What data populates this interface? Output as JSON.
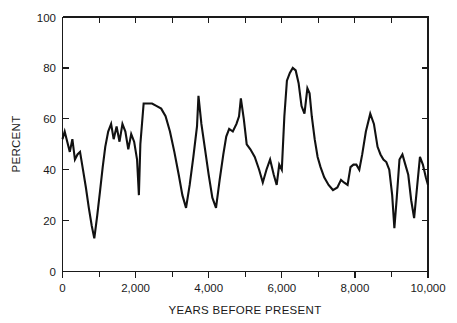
{
  "chart_data": {
    "type": "line",
    "title": "",
    "subtitle": "",
    "xlabel": "YEARS BEFORE PRESENT",
    "ylabel": "PERCENT",
    "xlim": [
      0,
      10000
    ],
    "ylim": [
      0,
      100
    ],
    "grid": false,
    "legend": null,
    "x_ticks": [
      0,
      2000,
      4000,
      6000,
      8000,
      10000
    ],
    "x_tick_labels": [
      "0",
      "2,000",
      "4,000",
      "6,000",
      "8,000",
      "10,000"
    ],
    "x_minor_ticks": [
      1000,
      3000,
      5000,
      7000,
      9000
    ],
    "y_ticks": [
      0,
      20,
      40,
      60,
      80,
      100
    ],
    "y_tick_labels": [
      "0",
      "20",
      "40",
      "60",
      "80",
      "100"
    ],
    "y_minor_ticks": [],
    "line_color": "#111111",
    "series": [
      {
        "name": "percent",
        "x": [
          0,
          60,
          130,
          200,
          270,
          340,
          410,
          480,
          560,
          640,
          720,
          800,
          870,
          950,
          1030,
          1100,
          1170,
          1250,
          1330,
          1400,
          1480,
          1560,
          1640,
          1720,
          1800,
          1880,
          1960,
          2040,
          2090,
          2130,
          2220,
          2330,
          2450,
          2580,
          2700,
          2820,
          2940,
          3060,
          3180,
          3280,
          3380,
          3480,
          3580,
          3680,
          3720,
          3800,
          3900,
          4000,
          4100,
          4200,
          4300,
          4400,
          4480,
          4560,
          4660,
          4760,
          4830,
          4880,
          4960,
          5040,
          5140,
          5260,
          5380,
          5480,
          5580,
          5680,
          5780,
          5860,
          5930,
          6000,
          6070,
          6140,
          6220,
          6300,
          6380,
          6460,
          6540,
          6620,
          6700,
          6760,
          6820,
          6900,
          6980,
          7060,
          7160,
          7280,
          7400,
          7520,
          7620,
          7700,
          7800,
          7880,
          7960,
          8040,
          8120,
          8200,
          8300,
          8420,
          8520,
          8620,
          8700,
          8780,
          8860,
          8940,
          9020,
          9080,
          9140,
          9220,
          9300,
          9380,
          9460,
          9540,
          9620,
          9700,
          9780,
          9860,
          9940,
          10000
        ],
        "y": [
          52,
          55,
          51,
          47,
          52,
          44,
          46,
          47,
          40,
          33,
          25,
          18,
          13,
          22,
          32,
          41,
          49,
          55,
          58,
          52,
          57,
          51,
          58,
          55,
          48,
          54,
          51,
          44,
          30,
          50,
          66,
          66,
          66,
          65,
          64,
          61,
          55,
          47,
          38,
          30,
          25,
          34,
          45,
          57,
          69,
          58,
          48,
          38,
          29,
          25,
          36,
          46,
          53,
          56,
          55,
          58,
          61,
          68,
          60,
          50,
          48,
          45,
          40,
          35,
          40,
          44,
          38,
          34,
          42,
          40,
          61,
          75,
          78,
          80,
          79,
          74,
          65,
          62,
          72,
          70,
          61,
          52,
          45,
          41,
          37,
          34,
          32,
          33,
          36,
          35,
          34,
          41,
          42,
          42,
          40,
          46,
          55,
          62,
          58,
          49,
          46,
          44,
          43,
          40,
          30,
          17,
          28,
          44,
          46,
          42,
          38,
          28,
          21,
          33,
          45,
          42,
          37,
          34
        ]
      }
    ]
  },
  "axis": {
    "x_title": "YEARS BEFORE PRESENT",
    "y_title": "PERCENT"
  }
}
